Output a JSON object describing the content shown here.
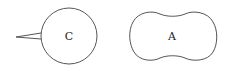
{
  "diagram": {
    "shapes": [
      {
        "id": "C",
        "label": "C",
        "type": "circle-with-spike"
      },
      {
        "id": "A",
        "label": "A",
        "type": "peanut"
      }
    ],
    "colors": {
      "stroke": "#555555",
      "background": "#ffffff",
      "text": "#222222"
    }
  }
}
